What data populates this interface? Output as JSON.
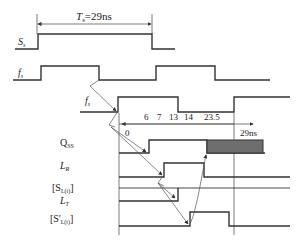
{
  "title_annotation": {
    "symbol": "T",
    "subscript": "s",
    "value": "=29ns"
  },
  "signals": [
    {
      "id": "Ss",
      "label": "S",
      "sub": "s"
    },
    {
      "id": "fs1",
      "label": "f",
      "sub": "s"
    },
    {
      "id": "fs2",
      "label": "f",
      "sub": "s"
    },
    {
      "id": "Qss",
      "label": "Q",
      "sub": "SS"
    },
    {
      "id": "LR",
      "label": "L",
      "sub": "R"
    },
    {
      "id": "SLt",
      "label": "[S",
      "sub": "L(t)",
      "suffix": "]"
    },
    {
      "id": "LT",
      "label": "L",
      "sub": "T"
    },
    {
      "id": "SpLt",
      "label": "[S'",
      "sub": "L(t)",
      "suffix": "]"
    }
  ],
  "time_axis": {
    "origin_label": "0",
    "end_label": "29ns",
    "ticks": [
      "6",
      "7",
      "13",
      "14",
      "23.5"
    ]
  },
  "colors": {
    "line": "#333333",
    "shaded": "#6e6e6e"
  }
}
